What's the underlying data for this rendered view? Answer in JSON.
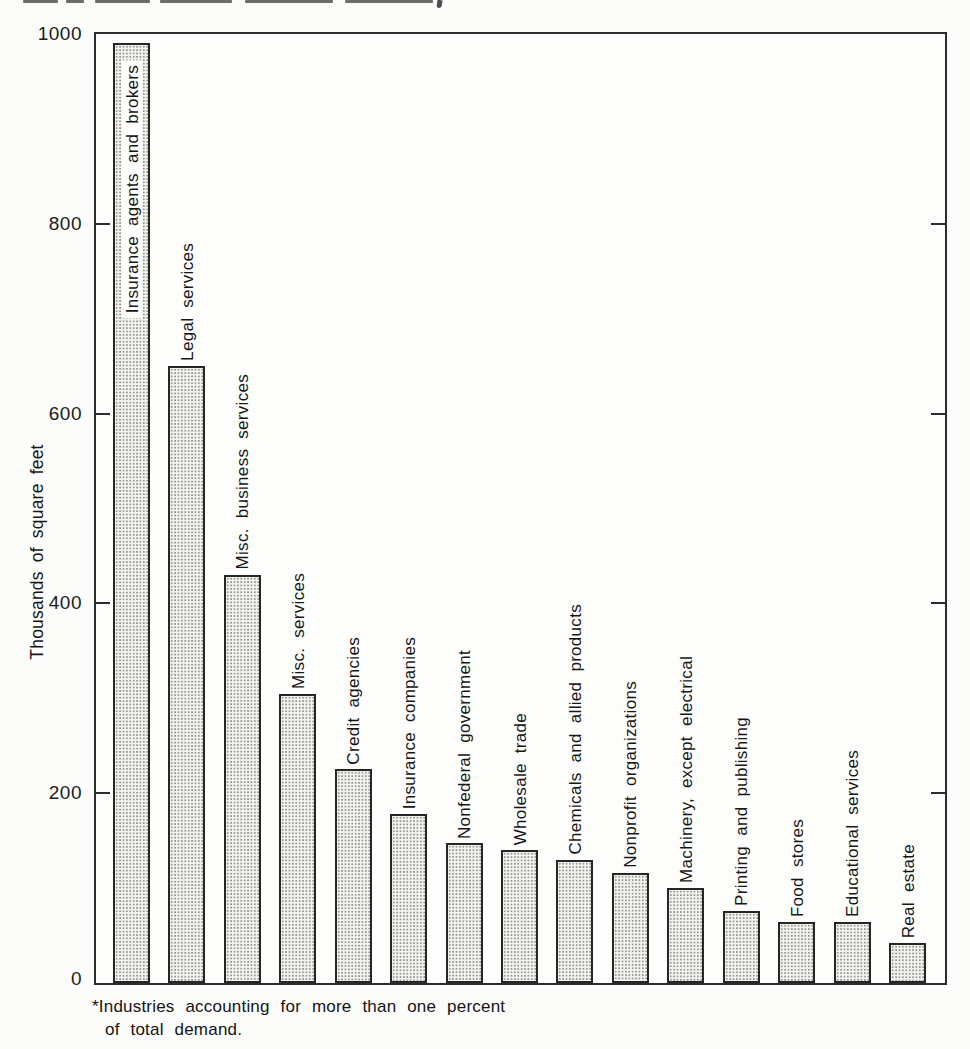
{
  "chart_data": {
    "type": "bar",
    "title": "",
    "xlabel": "",
    "ylabel": "Thousands of square feet",
    "ylim": [
      0,
      1000
    ],
    "yticks": [
      0,
      200,
      400,
      600,
      800,
      1000
    ],
    "grid": false,
    "legend": false,
    "bar_style": "halftone dot stipple fill with black outline",
    "categories": [
      "Insurance agents and brokers",
      "Legal services",
      "Misc. business services",
      "Misc. services",
      "Credit agencies",
      "Insurance companies",
      "Nonfederal government",
      "Wholesale trade",
      "Chemicals and allied products",
      "Nonprofit organizations",
      "Machinery, except electrical",
      "Printing and publishing",
      "Food stores",
      "Educational services",
      "Real estate"
    ],
    "values": [
      990,
      650,
      430,
      305,
      225,
      178,
      147,
      140,
      130,
      116,
      100,
      76,
      64,
      64,
      42
    ],
    "footnote": {
      "line1": "*Industries accounting for more than one percent",
      "line2": "of total demand."
    }
  },
  "colors": {
    "background": "#fcfcfa",
    "ink": "#1b1b1b",
    "bar_fill_base": "#f3f2ee",
    "bar_border": "#262626",
    "frame": "#2c2c2c"
  }
}
